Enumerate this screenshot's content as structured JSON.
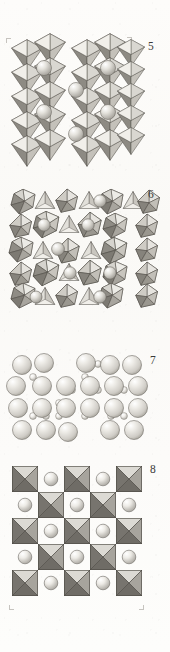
{
  "page": {
    "kind": "scanned-journal-figure-plate",
    "background_color": "#fbfaf8",
    "ink_color": "#3a3a38",
    "width_px": 170,
    "height_px": 652
  },
  "figures": [
    {
      "number": "5",
      "caption": "",
      "label_x": 148,
      "label_y": 41,
      "top": 38,
      "height": 130,
      "style": "polyhedral",
      "description": "Corner-sharing tilted octahedra framework viewed near [001]; large A-site cation spheres occupy cavities between the octahedra.",
      "polyhedra": "octahedra",
      "spheres_visible": 6,
      "has_crop_marks": true,
      "shading": {
        "face_light": "#e9e7e2",
        "face_mid": "#c6c3bc",
        "face_dark": "#8e8b84",
        "edge": "#55524c",
        "sphere_light": "#f2f1ec",
        "sphere_shadow": "#a8a59e"
      }
    },
    {
      "number": "6",
      "caption": "",
      "label_x": 148,
      "label_y": 191,
      "top": 193,
      "height": 122,
      "style": "polyhedral",
      "description": "Dense tilted octahedral/tetrahedral framework seen down a pseudo-cubic axis; rotated polyhedra create a pinwheel pattern with cation spheres in the tunnels.",
      "polyhedra": "octahedra-and-tetrahedra",
      "spheres_visible": 8,
      "has_crop_marks": false,
      "shading": {
        "face_light": "#ecebe6",
        "face_mid": "#bfbcb4",
        "face_dark": "#817e77",
        "edge": "#4e4b45",
        "sphere_light": "#f3f2ee",
        "sphere_shadow": "#a5a29b"
      }
    },
    {
      "number": "7",
      "caption": "",
      "label_x": 150,
      "label_y": 355,
      "top": 358,
      "height": 88,
      "style": "space-filling",
      "description": "Close-packed ball-and-stick / space-filling model: large anion spheres in rows with smaller cation spheres bridging between the layers.",
      "polyhedra": "none",
      "spheres_visible": 42,
      "has_crop_marks": false,
      "shading": {
        "sphere_light": "#f4f3ef",
        "sphere_mid": "#d8d6d0",
        "sphere_shadow": "#a3a099",
        "edge": "#6d6a64"
      }
    },
    {
      "number": "8",
      "caption": "",
      "label_x": 150,
      "label_y": 465,
      "top": 468,
      "height": 150,
      "style": "polyhedral",
      "description": "Ideal cubic perovskite projection: checkerboard of corner-sharing BO6 octahedra drawn as squares with X-shaped edges, alternating with A-site cation spheres.",
      "polyhedra": "octahedra",
      "grid_columns": 5,
      "grid_rows": 5,
      "spheres_visible": 12,
      "has_crop_marks": true,
      "shading": {
        "face_light": "#dcdad4",
        "face_mid": "#a7a49d",
        "face_dark": "#77746e",
        "edge": "#56534d",
        "sphere_light": "#f1f0ec",
        "sphere_shadow": "#a9a69f"
      }
    }
  ],
  "crop_marks": {
    "top_left": {
      "x": 6,
      "y": 38
    },
    "top_right": {
      "x": 129,
      "y": 37
    },
    "bottom_left": {
      "x": 9,
      "y": 610
    },
    "bottom_right": {
      "x": 143,
      "y": 610
    }
  }
}
